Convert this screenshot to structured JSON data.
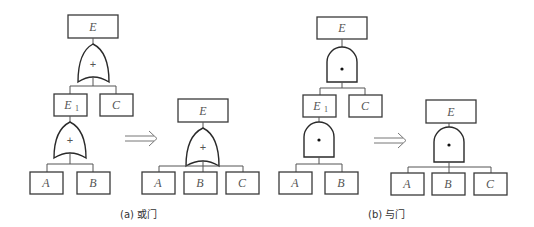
{
  "figure": {
    "panels": [
      {
        "id": "a",
        "caption": "(a) 或门",
        "gate_type": "OR",
        "gate_symbol": "+",
        "before": {
          "top_event": "E",
          "intermediate_event": "E",
          "intermediate_subscript": "1",
          "sibling_event": "C",
          "basic_events": [
            "A",
            "B"
          ]
        },
        "after": {
          "top_event": "E",
          "basic_events": [
            "A",
            "B",
            "C"
          ]
        }
      },
      {
        "id": "b",
        "caption": "(b) 与门",
        "gate_type": "AND",
        "gate_symbol": "•",
        "before": {
          "top_event": "E",
          "intermediate_event": "E",
          "intermediate_subscript": "1",
          "sibling_event": "C",
          "basic_events": [
            "A",
            "B"
          ]
        },
        "after": {
          "top_event": "E",
          "basic_events": [
            "A",
            "B",
            "C"
          ]
        }
      }
    ],
    "transform_arrow": "⟹"
  }
}
